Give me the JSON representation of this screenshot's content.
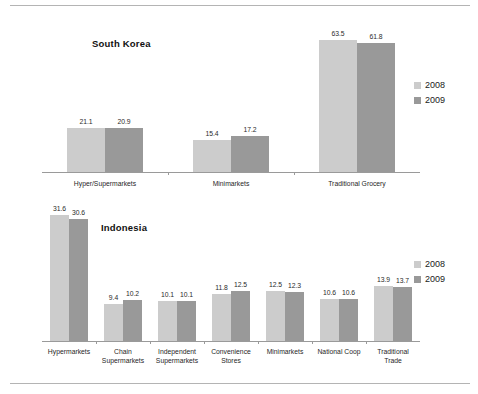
{
  "figure": {
    "background_color": "#ffffff",
    "rule_color": "#b4b4b4",
    "series_colors": {
      "2008": "#cccccc",
      "2009": "#999999"
    }
  },
  "legend": {
    "entries": [
      {
        "label": "2008",
        "color": "#cccccc"
      },
      {
        "label": "2009",
        "color": "#999999"
      }
    ]
  },
  "chart_data": [
    {
      "type": "bar",
      "title": "South Korea",
      "xlabel": "",
      "ylabel": "",
      "ylim": [
        0,
        70
      ],
      "grid": false,
      "legend_position": "right",
      "categories": [
        "Hyper/Supermarkets",
        "Minimarkets",
        "Traditional Grocery"
      ],
      "series": [
        {
          "name": "2008",
          "color": "#cccccc",
          "values": [
            21.1,
            15.4,
            63.5
          ]
        },
        {
          "name": "2009",
          "color": "#999999",
          "values": [
            20.9,
            17.2,
            61.8
          ]
        }
      ],
      "legend_entries": [
        "2008",
        "2009"
      ]
    },
    {
      "type": "bar",
      "title": "Indonesia",
      "xlabel": "",
      "ylabel": "",
      "ylim": [
        0,
        35
      ],
      "grid": false,
      "legend_position": "right",
      "categories": [
        "Hypermarkets",
        "Chain\nSupermarkets",
        "Independent\nSupermarkets",
        "Convenience\nStores",
        "Minimarkets",
        "National Coop",
        "Traditional\nTrade"
      ],
      "series": [
        {
          "name": "2008",
          "color": "#cccccc",
          "values": [
            31.6,
            9.4,
            10.1,
            11.8,
            12.5,
            10.6,
            13.9
          ]
        },
        {
          "name": "2009",
          "color": "#999999",
          "values": [
            30.6,
            10.2,
            10.1,
            12.5,
            12.3,
            10.6,
            13.7
          ]
        }
      ],
      "legend_entries": [
        "2008",
        "2009"
      ]
    }
  ]
}
